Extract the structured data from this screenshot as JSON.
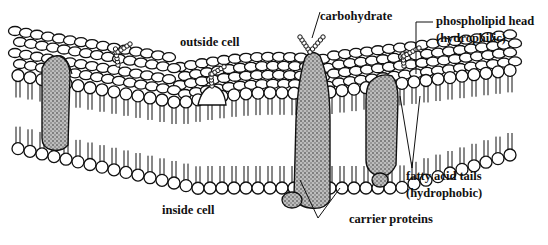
{
  "diagram": {
    "colors": {
      "ink": "#111111",
      "protein_fill": "#8a8a8a",
      "background": "#ffffff"
    },
    "labels": {
      "outside_cell": "outside cell",
      "inside_cell": "inside cell",
      "carbohydrate": "carbohydrate",
      "phospholipid_head_line1": "phospholipid head",
      "phospholipid_head_line2": "(hydrophilic)",
      "fatty_acid_tails_line1": "fatty acid tails",
      "fatty_acid_tails_line2": "(hydrophobic)",
      "carrier_proteins": "carrier proteins"
    }
  }
}
